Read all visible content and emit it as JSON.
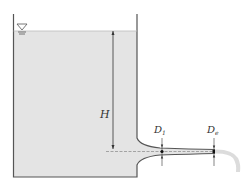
{
  "diagram": {
    "labels": {
      "head": "H",
      "throat_diameter": "D",
      "throat_subscript": "1",
      "exit_diameter": "D",
      "exit_subscript": "e"
    },
    "symbols": {
      "free_surface": "free-surface-triangle"
    },
    "colors": {
      "water": "#e4e4e4",
      "wall": "#555555",
      "line": "#333333",
      "jet": "#dcdcdc",
      "background": "#ffffff"
    }
  }
}
